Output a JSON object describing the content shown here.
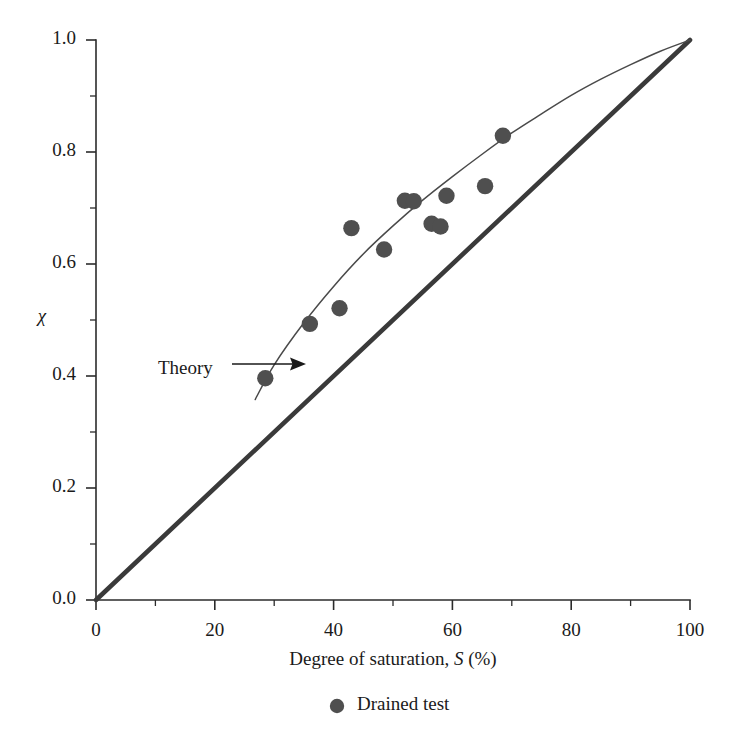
{
  "chart_data": {
    "type": "scatter",
    "title": "",
    "xlabel": "Degree of saturation, S (%)",
    "xlabel_parts": {
      "prefix": "Degree of saturation, ",
      "symbol": "S",
      "suffix": " (%)"
    },
    "ylabel": "χ",
    "xlim": [
      0,
      100
    ],
    "ylim": [
      0.0,
      1.0
    ],
    "grid": false,
    "xticks": [
      0,
      20,
      40,
      60,
      80,
      100
    ],
    "xtick_labels": [
      "0",
      "20",
      "40",
      "60",
      "80",
      "100"
    ],
    "xminor_ticks": [
      10,
      30,
      50,
      70,
      90
    ],
    "yticks": [
      0.0,
      0.2,
      0.4,
      0.6,
      0.8,
      1.0
    ],
    "ytick_labels": [
      "0.0",
      "0.2",
      "0.4",
      "0.6",
      "0.8",
      "1.0"
    ],
    "yminor_ticks": [
      0.1,
      0.3,
      0.5,
      0.7,
      0.9
    ],
    "legend_position": "below-axis-center",
    "series": [
      {
        "name": "Drained test",
        "type": "scatter",
        "marker": "filled-circle",
        "color": "#4f4f4f",
        "points": [
          {
            "x": 28.5,
            "y": 0.396
          },
          {
            "x": 36.0,
            "y": 0.493
          },
          {
            "x": 41.0,
            "y": 0.521
          },
          {
            "x": 43.0,
            "y": 0.664
          },
          {
            "x": 48.5,
            "y": 0.626
          },
          {
            "x": 52.0,
            "y": 0.713
          },
          {
            "x": 53.5,
            "y": 0.712
          },
          {
            "x": 56.5,
            "y": 0.672
          },
          {
            "x": 58.0,
            "y": 0.667
          },
          {
            "x": 59.0,
            "y": 0.722
          },
          {
            "x": 65.5,
            "y": 0.739
          },
          {
            "x": 68.5,
            "y": 0.829
          }
        ]
      },
      {
        "name": "Theory",
        "type": "line",
        "color": "#4a4a4a",
        "points": [
          {
            "x": 26.8,
            "y": 0.358
          },
          {
            "x": 30.0,
            "y": 0.42
          },
          {
            "x": 35.0,
            "y": 0.495
          },
          {
            "x": 40.0,
            "y": 0.56
          },
          {
            "x": 45.0,
            "y": 0.618
          },
          {
            "x": 50.0,
            "y": 0.668
          },
          {
            "x": 55.0,
            "y": 0.714
          },
          {
            "x": 60.0,
            "y": 0.756
          },
          {
            "x": 65.0,
            "y": 0.796
          },
          {
            "x": 70.0,
            "y": 0.834
          },
          {
            "x": 75.0,
            "y": 0.868
          },
          {
            "x": 80.0,
            "y": 0.901
          },
          {
            "x": 85.0,
            "y": 0.93
          },
          {
            "x": 90.0,
            "y": 0.956
          },
          {
            "x": 95.0,
            "y": 0.98
          },
          {
            "x": 100.0,
            "y": 1.0
          }
        ]
      },
      {
        "name": "chi equals S line",
        "type": "line",
        "color": "#3a3a3a",
        "points": [
          {
            "x": 0.0,
            "y": 0.0
          },
          {
            "x": 100.0,
            "y": 1.0
          }
        ]
      }
    ],
    "annotations": [
      {
        "text": "Theory",
        "x": 27.0,
        "y": 0.455,
        "arrow_to": {
          "x": 33.0,
          "y": 0.462
        }
      }
    ]
  },
  "legend": {
    "entries": [
      {
        "label": "Drained test",
        "marker": "filled-circle",
        "color": "#4f4f4f"
      }
    ]
  },
  "colors": {
    "axis": "#2b2b2b",
    "marker": "#4f4f4f",
    "theory_curve": "#4a4a4a",
    "diagonal": "#3a3a3a",
    "text": "#1a1a1a",
    "background": "#ffffff"
  }
}
